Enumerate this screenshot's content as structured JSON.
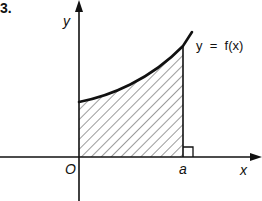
{
  "problem_number": "3.",
  "axes": {
    "x_label": "x",
    "y_label": "y",
    "origin_label": "O"
  },
  "curve_label": "y  =  f(x)",
  "bound_label": "a",
  "figure": {
    "shading": "diagonal hatching",
    "right_angle_marker_at": "a"
  }
}
